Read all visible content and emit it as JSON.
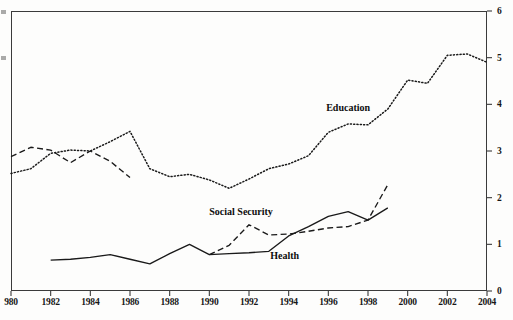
{
  "chart_data": {
    "type": "line",
    "title": "",
    "subtitle": "",
    "xlabel": "",
    "ylabel": "",
    "xlim": [
      1980,
      2004
    ],
    "ylim": [
      0,
      6
    ],
    "grid": false,
    "legend_position": "inline-annotations",
    "x_ticks": [
      1980,
      1982,
      1984,
      1986,
      1988,
      1990,
      1992,
      1994,
      1996,
      1998,
      2000,
      2002,
      2004
    ],
    "x_tick_labels": [
      "980",
      "1982",
      "1984",
      "1986",
      "1988",
      "1990",
      "1992",
      "1994",
      "1996",
      "1998",
      "2000",
      "2002",
      "2004"
    ],
    "y_ticks": [
      0,
      1,
      2,
      3,
      4,
      5,
      6
    ],
    "y_tick_labels": [
      "0",
      "1",
      "2",
      "3",
      "4",
      "5",
      "6"
    ],
    "y_axis_side": "right",
    "series": [
      {
        "name": "Education",
        "style": "dotted",
        "color": "#1a1a1a",
        "x": [
          1980,
          1981,
          1982,
          1983,
          1984,
          1985,
          1986,
          1987,
          1988,
          1989,
          1990,
          1991,
          1992,
          1993,
          1994,
          1995,
          1996,
          1997,
          1998,
          1999,
          2000,
          2001,
          2002,
          2003,
          2004
        ],
        "values": [
          2.52,
          2.62,
          2.95,
          3.02,
          3.0,
          3.2,
          3.42,
          2.62,
          2.45,
          2.5,
          2.38,
          2.2,
          2.4,
          2.62,
          2.72,
          2.9,
          3.4,
          3.58,
          3.56,
          3.9,
          4.52,
          4.45,
          5.05,
          5.08,
          4.9
        ]
      },
      {
        "name": "Social Security",
        "style": "dashed",
        "color": "#1a1a1a",
        "segments": [
          {
            "x": [
              1980,
              1981,
              1982,
              1983,
              1984,
              1985,
              1986
            ],
            "values": [
              2.88,
              3.08,
              3.02,
              2.75,
              3.0,
              2.78,
              2.43
            ]
          },
          {
            "x": [
              1990,
              1991,
              1992,
              1993,
              1994,
              1995,
              1996,
              1997,
              1998,
              1999
            ],
            "values": [
              0.78,
              0.98,
              1.42,
              1.2,
              1.22,
              1.28,
              1.35,
              1.38,
              1.52,
              2.28
            ]
          }
        ]
      },
      {
        "name": "Health",
        "style": "solid",
        "color": "#1a1a1a",
        "x": [
          1982,
          1983,
          1984,
          1985,
          1986,
          1987,
          1988,
          1989,
          1990,
          1991,
          1992,
          1993,
          1994,
          1995,
          1996,
          1997,
          1998,
          1999
        ],
        "values": [
          0.66,
          0.68,
          0.72,
          0.78,
          0.68,
          0.58,
          0.8,
          1.0,
          0.78,
          0.8,
          0.82,
          0.85,
          1.18,
          1.38,
          1.6,
          1.7,
          1.52,
          1.78
        ]
      }
    ],
    "annotations": [
      {
        "text": "Education",
        "x": 1997.0,
        "y": 3.95
      },
      {
        "text": "Social Security",
        "x": 1991.6,
        "y": 1.72
      },
      {
        "text": "Health",
        "x": 1993.8,
        "y": 0.78
      }
    ]
  }
}
